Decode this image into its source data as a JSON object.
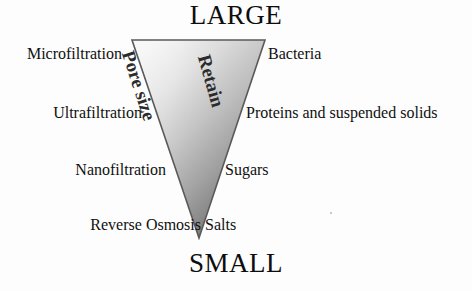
{
  "diagram": {
    "title_top": "LARGE",
    "title_bottom": "SMALL",
    "funnel": {
      "axis_label_left": "Pore size",
      "axis_label_right": "Retain",
      "gradient_light": "#f2f2f2",
      "gradient_mid": "#b9b9b9",
      "gradient_dark": "#6e6e6e",
      "outline_color": "#4a4a4a"
    },
    "rows": [
      {
        "process": "Microfiltration",
        "retained": "Bacteria"
      },
      {
        "process": "Ultrafiltration",
        "retained": "Proteins and suspended solids"
      },
      {
        "process": "Nanofiltration",
        "retained": "Sugars"
      },
      {
        "process": "Reverse Osmosis",
        "retained": "Salts"
      }
    ]
  }
}
